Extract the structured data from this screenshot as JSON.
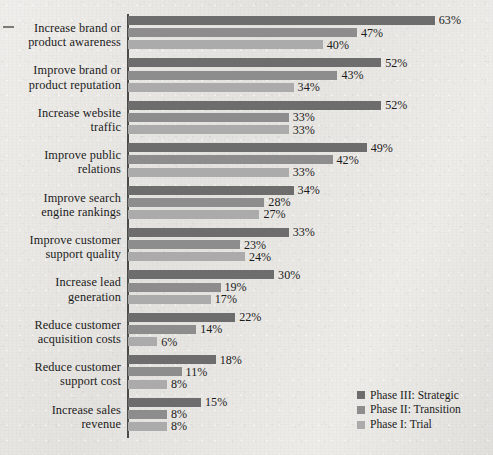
{
  "chart_data": {
    "type": "bar",
    "orientation": "horizontal",
    "title": "",
    "xlabel": "",
    "ylabel": "",
    "xlim": [
      0,
      63
    ],
    "grid": false,
    "legend_position": "bottom-right",
    "value_suffix": "%",
    "categories": [
      "Increase brand or product awareness",
      "Improve brand or product reputation",
      "Increase website traffic",
      "Improve public relations",
      "Improve search engine rankings",
      "Improve customer support quality",
      "Increase lead generation",
      "Reduce customer acquisition costs",
      "Reduce customer support cost",
      "Increase sales revenue"
    ],
    "series": [
      {
        "name": "Phase III: Strategic",
        "color": "#6d6d6d",
        "values": [
          63,
          52,
          52,
          49,
          34,
          33,
          30,
          22,
          18,
          15
        ],
        "labels": [
          "63%",
          "52%",
          "52%",
          "49%",
          "34%",
          "33%",
          "30%",
          "22%",
          "18%",
          "15%"
        ]
      },
      {
        "name": "Phase II: Transition",
        "color": "#8d8d8d",
        "values": [
          47,
          43,
          33,
          42,
          28,
          23,
          19,
          14,
          11,
          8
        ],
        "labels": [
          "47%",
          "43%",
          "33%",
          "42%",
          "28%",
          "23%",
          "19%",
          "14%",
          "11%",
          "8%"
        ]
      },
      {
        "name": "Phase I: Trial",
        "color": "#ababab",
        "values": [
          40,
          34,
          33,
          33,
          27,
          24,
          17,
          6,
          8,
          8
        ],
        "labels": [
          "40%",
          "34%",
          "33%",
          "33%",
          "27%",
          "24%",
          "17%",
          "6%",
          "8%",
          "8%"
        ]
      }
    ]
  },
  "category_lines": [
    [
      "Increase brand or",
      "product awareness"
    ],
    [
      "Improve brand or",
      "product reputation"
    ],
    [
      "Increase website",
      "traffic"
    ],
    [
      "Improve public",
      "relations"
    ],
    [
      "Improve search",
      "engine rankings"
    ],
    [
      "Improve customer",
      "support quality"
    ],
    [
      "Increase lead",
      "generation"
    ],
    [
      "Reduce customer",
      "acquisition costs"
    ],
    [
      "Reduce customer",
      "support cost"
    ],
    [
      "Increase sales",
      "revenue"
    ]
  ],
  "legend": {
    "items": [
      {
        "label": "Phase III: Strategic",
        "key": "p3"
      },
      {
        "label": "Phase II: Transition",
        "key": "p2"
      },
      {
        "label": "Phase I: Trial",
        "key": "p1"
      }
    ]
  }
}
